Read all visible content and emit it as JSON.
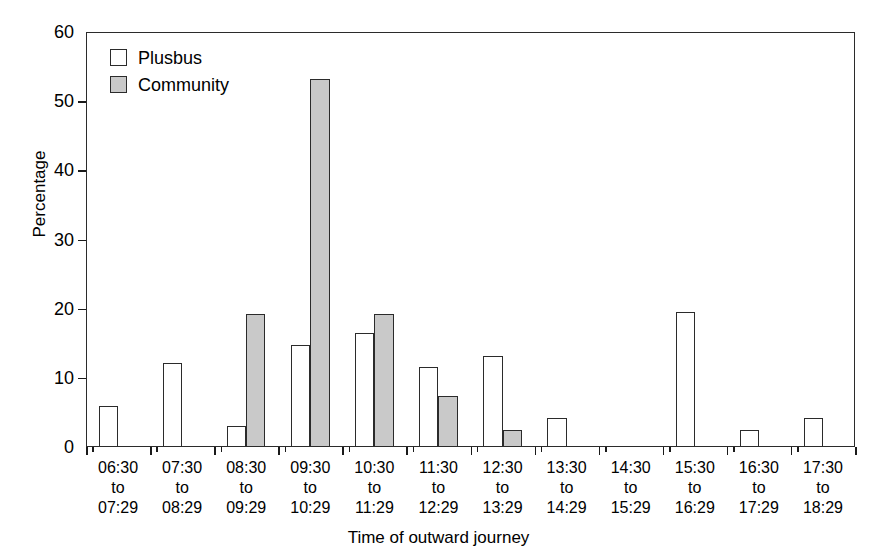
{
  "chart_data": {
    "type": "bar",
    "title": "",
    "xlabel": "Time of outward journey",
    "ylabel": "Percentage",
    "ylim": [
      0,
      60
    ],
    "yticks": [
      0,
      10,
      20,
      30,
      40,
      50,
      60
    ],
    "grid": false,
    "legend_position": "top-left",
    "categories": [
      "06:30\nto\n07:29",
      "07:30\nto\n08:29",
      "08:30\nto\n09:29",
      "09:30\nto\n10:29",
      "10:30\nto\n11:29",
      "11:30\nto\n12:29",
      "12:30\nto\n13:29",
      "13:30\nto\n14:29",
      "14:30\nto\n15:29",
      "15:30\nto\n16:29",
      "16:30\nto\n17:29",
      "17:30\nto\n18:29"
    ],
    "category_lines": [
      [
        "06:30",
        "to",
        "07:29"
      ],
      [
        "07:30",
        "to",
        "08:29"
      ],
      [
        "08:30",
        "to",
        "09:29"
      ],
      [
        "09:30",
        "to",
        "10:29"
      ],
      [
        "10:30",
        "to",
        "11:29"
      ],
      [
        "11:30",
        "to",
        "12:29"
      ],
      [
        "12:30",
        "to",
        "13:29"
      ],
      [
        "13:30",
        "to",
        "14:29"
      ],
      [
        "14:30",
        "to",
        "15:29"
      ],
      [
        "15:30",
        "to",
        "16:29"
      ],
      [
        "16:30",
        "to",
        "17:29"
      ],
      [
        "17:30",
        "to",
        "18:29"
      ]
    ],
    "series": [
      {
        "name": "Plusbus",
        "color": "#ffffff",
        "edge_color": "#2b2b2b",
        "values": [
          5.9,
          12.2,
          3.1,
          14.8,
          16.5,
          11.6,
          13.1,
          4.2,
          0,
          19.5,
          2.5,
          4.2
        ]
      },
      {
        "name": "Community",
        "color": "#c9c9c9",
        "edge_color": "#2b2b2b",
        "values": [
          0,
          0,
          19.3,
          53.2,
          19.3,
          7.4,
          2.4,
          0,
          0,
          0,
          0,
          0
        ]
      }
    ]
  },
  "legend": {
    "items": [
      {
        "label": "Plusbus",
        "swatch": "plusbus"
      },
      {
        "label": "Community",
        "swatch": "community"
      }
    ]
  },
  "axes": {
    "y_title": "Percentage",
    "x_title": "Time of outward journey"
  }
}
